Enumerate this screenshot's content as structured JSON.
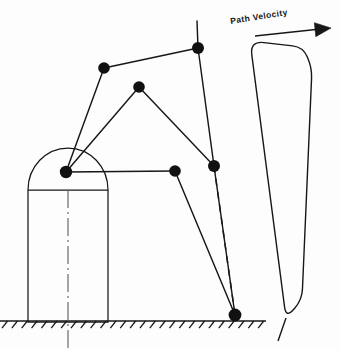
{
  "diagram": {
    "type": "mechanism-kinematics-sketch",
    "stroke_color": "#17171a",
    "joint_color": "#111111",
    "background_color": "#ffffff"
  },
  "annotations": {
    "path_velocity_label": "Path Velocity",
    "path_velocity_label_rotation_deg": -9
  },
  "base": {
    "name": "pedestal",
    "body": {
      "left": 28,
      "right": 108,
      "top": 190,
      "bottom": 322
    },
    "dome": {
      "cx": 68,
      "cy": 190,
      "rx": 40,
      "ry": 42
    },
    "shoulder_line_y": 190,
    "centerline_x": 68,
    "centerline_style": "dash-dot",
    "centerline_top": 190,
    "centerline_bottom": 348
  },
  "ground": {
    "name": "ground-line",
    "y": 321,
    "x_start": 0,
    "x_end": 266,
    "hatch_count": 27,
    "hatch_length": 9,
    "hatch_angle_deg": 52
  },
  "joints": [
    {
      "id": "J1",
      "name": "shoulder-pivot",
      "x": 66,
      "y": 172,
      "r": 6.2
    },
    {
      "id": "J2",
      "name": "upper-left-joint",
      "x": 104,
      "y": 68,
      "r": 5.8
    },
    {
      "id": "J3",
      "name": "upper-right-joint",
      "x": 198,
      "y": 48,
      "r": 6.0
    },
    {
      "id": "J4",
      "name": "apex-joint",
      "x": 139,
      "y": 87,
      "r": 5.8
    },
    {
      "id": "J5",
      "name": "mid-arm-joint",
      "x": 175,
      "y": 171,
      "r": 5.8
    },
    {
      "id": "J6",
      "name": "right-elbow-joint",
      "x": 214,
      "y": 166,
      "r": 6.0
    },
    {
      "id": "J7",
      "name": "tool-tip-joint",
      "x": 235,
      "y": 315,
      "r": 6.4
    }
  ],
  "links": [
    {
      "name": "link-shoulder-to-upper-left",
      "from": [
        66,
        172
      ],
      "to": [
        104,
        68
      ]
    },
    {
      "name": "link-upper-left-to-upper-right",
      "from": [
        104,
        68
      ],
      "to": [
        198,
        48
      ]
    },
    {
      "name": "link-shoulder-to-apex",
      "from": [
        66,
        172
      ],
      "to": [
        139,
        87
      ]
    },
    {
      "name": "link-apex-to-right-elbow",
      "from": [
        139,
        87
      ],
      "to": [
        214,
        166
      ]
    },
    {
      "name": "link-shoulder-to-mid-arm",
      "from": [
        66,
        172
      ],
      "to": [
        175,
        171
      ]
    },
    {
      "name": "link-mid-arm-to-tool-tip",
      "from": [
        175,
        171
      ],
      "to": [
        235,
        315
      ]
    },
    {
      "name": "link-upper-right-vertical-extension",
      "from": [
        197,
        21
      ],
      "to": [
        198,
        48
      ]
    },
    {
      "name": "link-upper-right-to-right-elbow",
      "from": [
        198,
        48
      ],
      "to": [
        214,
        166
      ]
    },
    {
      "name": "link-right-elbow-to-tool-tip",
      "from": [
        214,
        166
      ],
      "to": [
        235,
        315
      ]
    }
  ],
  "dashed_lines": [
    {
      "name": "dashed-path-trace",
      "from": [
        214,
        166
      ],
      "to": [
        235,
        315
      ],
      "dash": "7 6"
    }
  ],
  "velocity_profile": {
    "name": "trapezoidal-velocity-profile",
    "description": "Trapezoidal path-velocity curve with rounded ramp corners",
    "outline": [
      [
        250,
        41
      ],
      [
        303,
        47
      ],
      [
        312,
        68
      ],
      [
        302,
        300
      ],
      [
        286,
        318
      ],
      [
        250,
        41
      ]
    ],
    "corner_radius": 14,
    "baseline": {
      "from": [
        286,
        318
      ],
      "to": [
        278,
        341
      ]
    },
    "arrow": {
      "name": "path-velocity-arrow",
      "tail": [
        255,
        36
      ],
      "head": [
        331,
        28
      ],
      "head_width": 7,
      "head_length": 16
    }
  }
}
